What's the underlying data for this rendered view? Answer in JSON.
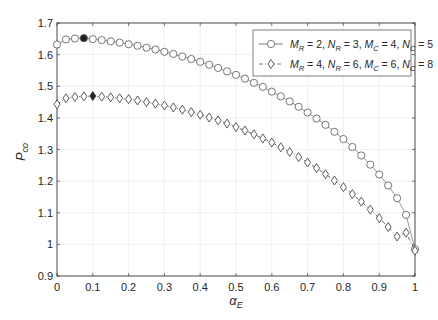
{
  "chart_data": {
    "type": "line",
    "title": "",
    "xlabel": "α_E",
    "ylabel": "P_co",
    "xlim": [
      0,
      1
    ],
    "ylim": [
      0.9,
      1.7
    ],
    "xticks": [
      "0",
      "0.1",
      "0.2",
      "0.3",
      "0.4",
      "0.5",
      "0.6",
      "0.7",
      "0.8",
      "0.9",
      "1"
    ],
    "yticks": [
      "0.9",
      "1",
      "1.1",
      "1.2",
      "1.3",
      "1.4",
      "1.5",
      "1.6",
      "1.7"
    ],
    "grid": true,
    "legend_position": "upper right",
    "x": [
      0,
      0.025,
      0.05,
      0.075,
      0.1,
      0.125,
      0.15,
      0.175,
      0.2,
      0.225,
      0.25,
      0.275,
      0.3,
      0.325,
      0.35,
      0.375,
      0.4,
      0.425,
      0.45,
      0.475,
      0.5,
      0.525,
      0.55,
      0.575,
      0.6,
      0.625,
      0.65,
      0.675,
      0.7,
      0.725,
      0.75,
      0.775,
      0.8,
      0.825,
      0.85,
      0.875,
      0.9,
      0.925,
      0.95,
      0.975,
      1
    ],
    "series": [
      {
        "name": "M_R = 2, N_R = 3, M_C = 4, N_C = 5",
        "marker": "circle",
        "line": "solid",
        "highlight_index": 3,
        "values": [
          1.632,
          1.648,
          1.651,
          1.652,
          1.649,
          1.646,
          1.642,
          1.638,
          1.633,
          1.628,
          1.622,
          1.616,
          1.609,
          1.602,
          1.594,
          1.586,
          1.577,
          1.568,
          1.558,
          1.547,
          1.536,
          1.524,
          1.511,
          1.498,
          1.483,
          1.468,
          1.452,
          1.435,
          1.417,
          1.398,
          1.378,
          1.356,
          1.333,
          1.308,
          1.281,
          1.252,
          1.221,
          1.186,
          1.146,
          1.093,
          0.985
        ]
      },
      {
        "name": "M_R = 4, N_R = 6, M_C = 6, N_C = 8",
        "marker": "diamond",
        "line": "dashdot",
        "highlight_index": 4,
        "values": [
          1.443,
          1.462,
          1.466,
          1.468,
          1.469,
          1.467,
          1.465,
          1.462,
          1.459,
          1.455,
          1.45,
          1.445,
          1.439,
          1.433,
          1.426,
          1.418,
          1.41,
          1.401,
          1.392,
          1.382,
          1.371,
          1.36,
          1.348,
          1.335,
          1.322,
          1.307,
          1.292,
          1.276,
          1.259,
          1.241,
          1.222,
          1.202,
          1.181,
          1.159,
          1.135,
          1.11,
          1.083,
          1.055,
          1.025,
          1.037,
          0.98
        ]
      }
    ]
  }
}
